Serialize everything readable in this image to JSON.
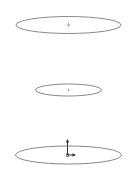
{
  "viewport": {
    "background": "#ffffff",
    "stroke_color": "#8a8a8a",
    "marker_color": "#9a9a9a",
    "triad_color": "#333333"
  },
  "sketches": [
    {
      "name": "top-circle",
      "cx": 68.5,
      "cy": 25,
      "rx": 52.5,
      "ry": 8.5,
      "center_marker": "plus"
    },
    {
      "name": "middle-circle",
      "cx": 68.5,
      "cy": 90,
      "rx": 33,
      "ry": 6,
      "center_marker": "dot"
    },
    {
      "name": "bottom-circle",
      "cx": 68.5,
      "cy": 155,
      "rx": 53,
      "ry": 9,
      "center_marker": "triad"
    }
  ],
  "triad": {
    "origin_x": 67.5,
    "origin_y": 155,
    "y_axis_length": 14,
    "x_axis_length": 8,
    "icon": "coordinate-triad-icon"
  }
}
